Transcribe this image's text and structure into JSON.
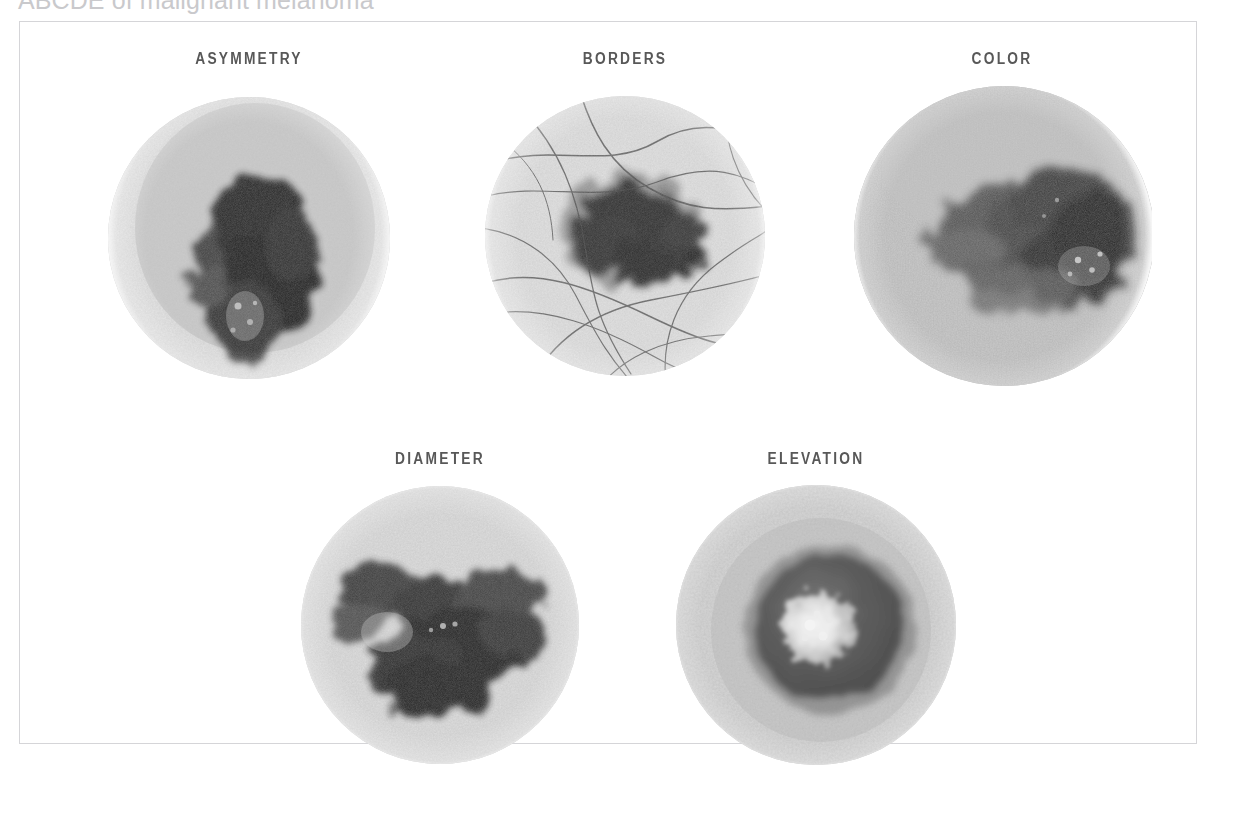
{
  "figure": {
    "title": "ABCDE of malignant melanoma",
    "frame_color": "#d5d5d8",
    "background": "#ffffff",
    "label_color": "#585858",
    "rendering": "grayscale halftone print reproduction"
  },
  "panels": [
    {
      "id": "asymmetry",
      "label": "ASYMMETRY",
      "row": 1,
      "column": 1,
      "image": {
        "kind": "dermoscopy-photograph",
        "shape": "circular-vignette",
        "skin_tone": "#c8c8c8",
        "lesion_tone": "#2b2b2b",
        "description": "Irregular asymmetric dark pigmented lesion with uneven lobes on speckled light skin",
        "features": [
          "asymmetric halves",
          "irregular lobed outline",
          "speckled skin texture",
          "bright keratin flecks at centre"
        ]
      }
    },
    {
      "id": "borders",
      "label": "BORDERS",
      "row": 1,
      "column": 2,
      "image": {
        "kind": "dermoscopy-photograph",
        "shape": "circular-vignette",
        "skin_tone": "#cacaca",
        "lesion_tone": "#1f1f1f",
        "description": "Dark lesion with notched, poorly defined borders; many fine dark hairs cross the field",
        "features": [
          "notched irregular border",
          "blurred fading edge",
          "overlying terminal hairs",
          "skin furrow lines"
        ]
      }
    },
    {
      "id": "color",
      "label": "COLOR",
      "row": 1,
      "column": 3,
      "image": {
        "kind": "dermoscopy-photograph",
        "shape": "circular-vignette",
        "skin_tone": "#a9a9a9",
        "lesion_tone": "#333333",
        "description": "Lesion showing multiple shades from light grey through to near black with pale depigmented zones",
        "features": [
          "variegated pigmentation",
          "multiple grey tones",
          "darker central crust",
          "white flecks"
        ]
      }
    },
    {
      "id": "diameter",
      "label": "DIAMETER",
      "row": 2,
      "column": 1,
      "image": {
        "kind": "dermoscopy-photograph",
        "shape": "circular-vignette",
        "skin_tone": "#c4c4c4",
        "lesion_tone": "#272727",
        "description": "Broad dark lesion spanning most of the field, indicating a large diameter",
        "features": [
          "wide horizontal extent",
          "multiple coalescing dark lobes",
          "central pale island"
        ]
      }
    },
    {
      "id": "elevation",
      "label": "ELEVATION",
      "row": 2,
      "column": 2,
      "image": {
        "kind": "dermoscopy-photograph",
        "shape": "circular-vignette",
        "skin_tone": "#b8b8b8",
        "lesion_tone": "#3a3a3a",
        "description": "Raised nodular lesion with a domed dark rim and a bright highlighted elevated centre",
        "features": [
          "raised dome",
          "bright specular highlight on apex",
          "shadowed rim",
          "smooth surrounding skin"
        ]
      }
    }
  ]
}
